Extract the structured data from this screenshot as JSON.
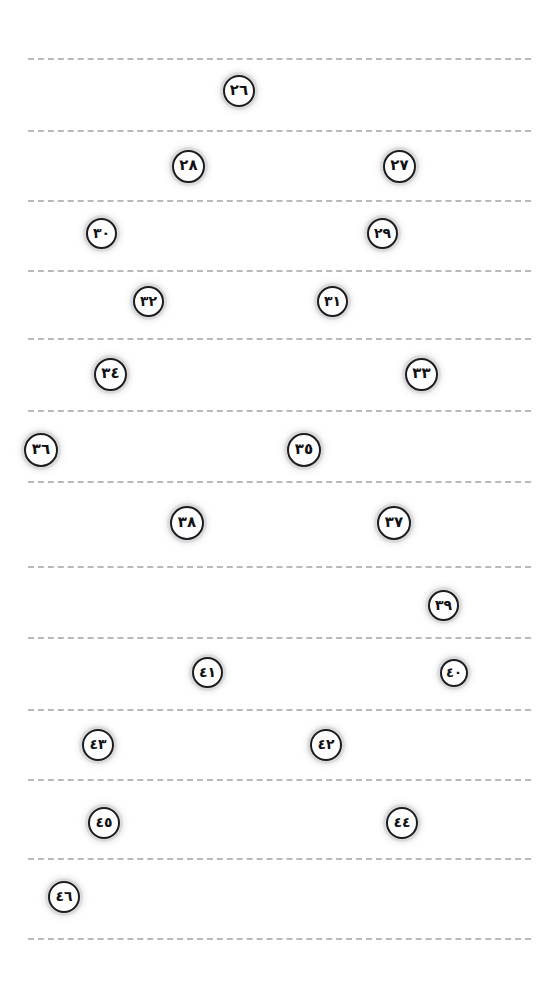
{
  "page": {
    "kind": "ruled-worksheet",
    "width": 559,
    "height": 987,
    "background_color": "#ffffff",
    "line_color": "#b9b9bd",
    "badge_border_color": "#1d1d1f",
    "badge_fill_color": "#ffffff",
    "badge_text_color": "#111114",
    "badge_halo_color": "#bebec3",
    "numeral_system": "arabic-indic",
    "reading_direction": "rtl"
  },
  "rules": [
    {
      "id": "rule-1",
      "y": 58,
      "x": 28,
      "width": 503
    },
    {
      "id": "rule-2",
      "y": 130,
      "x": 28,
      "width": 503
    },
    {
      "id": "rule-3",
      "y": 200,
      "x": 28,
      "width": 503
    },
    {
      "id": "rule-4",
      "y": 270,
      "x": 28,
      "width": 503
    },
    {
      "id": "rule-5",
      "y": 338,
      "x": 28,
      "width": 503
    },
    {
      "id": "rule-6",
      "y": 410,
      "x": 28,
      "width": 503
    },
    {
      "id": "rule-7",
      "y": 481,
      "x": 28,
      "width": 503
    },
    {
      "id": "rule-8",
      "y": 566,
      "x": 28,
      "width": 503
    },
    {
      "id": "rule-9",
      "y": 637,
      "x": 28,
      "width": 503
    },
    {
      "id": "rule-10",
      "y": 709,
      "x": 28,
      "width": 503
    },
    {
      "id": "rule-11",
      "y": 779,
      "x": 28,
      "width": 503
    },
    {
      "id": "rule-12",
      "y": 858,
      "x": 28,
      "width": 503
    },
    {
      "id": "rule-13",
      "y": 938,
      "x": 28,
      "width": 503
    }
  ],
  "badges": [
    {
      "id": "badge-26",
      "label": "٢٦",
      "value": 26,
      "x": 223,
      "y": 75,
      "size": 32,
      "font_size": 15
    },
    {
      "id": "badge-28",
      "label": "٢٨",
      "value": 28,
      "x": 172,
      "y": 150,
      "size": 33,
      "font_size": 15
    },
    {
      "id": "badge-27",
      "label": "٢٧",
      "value": 27,
      "x": 383,
      "y": 150,
      "size": 33,
      "font_size": 15
    },
    {
      "id": "badge-30",
      "label": "٣٠",
      "value": 30,
      "x": 86,
      "y": 218,
      "size": 31,
      "font_size": 14
    },
    {
      "id": "badge-29",
      "label": "٢٩",
      "value": 29,
      "x": 367,
      "y": 218,
      "size": 31,
      "font_size": 14
    },
    {
      "id": "badge-32",
      "label": "٣٢",
      "value": 32,
      "x": 133,
      "y": 286,
      "size": 31,
      "font_size": 14
    },
    {
      "id": "badge-31",
      "label": "٣١",
      "value": 31,
      "x": 317,
      "y": 286,
      "size": 31,
      "font_size": 14
    },
    {
      "id": "badge-34",
      "label": "٣٤",
      "value": 34,
      "x": 94,
      "y": 358,
      "size": 33,
      "font_size": 15
    },
    {
      "id": "badge-33",
      "label": "٣٣",
      "value": 33,
      "x": 405,
      "y": 358,
      "size": 33,
      "font_size": 15
    },
    {
      "id": "badge-36",
      "label": "٣٦",
      "value": 36,
      "x": 24,
      "y": 433,
      "size": 34,
      "font_size": 15
    },
    {
      "id": "badge-35",
      "label": "٣٥",
      "value": 35,
      "x": 287,
      "y": 433,
      "size": 34,
      "font_size": 15
    },
    {
      "id": "badge-38",
      "label": "٣٨",
      "value": 38,
      "x": 170,
      "y": 506,
      "size": 34,
      "font_size": 15
    },
    {
      "id": "badge-37",
      "label": "٣٧",
      "value": 37,
      "x": 377,
      "y": 506,
      "size": 34,
      "font_size": 15
    },
    {
      "id": "badge-39",
      "label": "٣٩",
      "value": 39,
      "x": 428,
      "y": 590,
      "size": 31,
      "font_size": 14
    },
    {
      "id": "badge-41",
      "label": "٤١",
      "value": 41,
      "x": 192,
      "y": 657,
      "size": 31,
      "font_size": 14
    },
    {
      "id": "badge-40",
      "label": "٤٠",
      "value": 40,
      "x": 440,
      "y": 659,
      "size": 28,
      "font_size": 13
    },
    {
      "id": "badge-43",
      "label": "٤٣",
      "value": 43,
      "x": 82,
      "y": 729,
      "size": 32,
      "font_size": 14
    },
    {
      "id": "badge-42",
      "label": "٤٢",
      "value": 42,
      "x": 310,
      "y": 729,
      "size": 32,
      "font_size": 14
    },
    {
      "id": "badge-45",
      "label": "٤٥",
      "value": 45,
      "x": 88,
      "y": 807,
      "size": 32,
      "font_size": 14
    },
    {
      "id": "badge-44",
      "label": "٤٤",
      "value": 44,
      "x": 386,
      "y": 807,
      "size": 32,
      "font_size": 14
    },
    {
      "id": "badge-46",
      "label": "٤٦",
      "value": 46,
      "x": 48,
      "y": 881,
      "size": 32,
      "font_size": 14
    }
  ]
}
